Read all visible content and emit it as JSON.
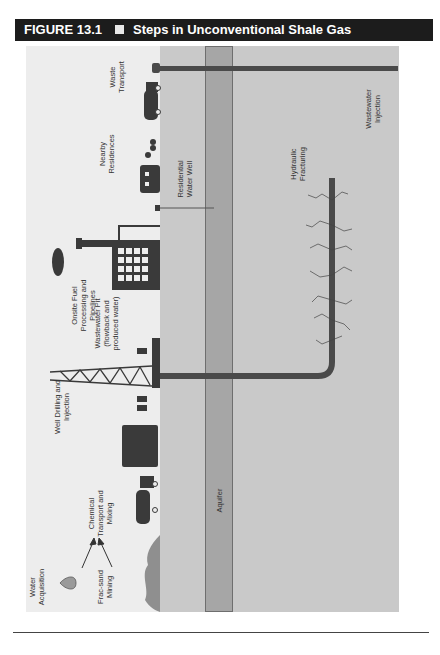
{
  "figure": {
    "number": "FIGURE 13.1",
    "separator": "■",
    "title": "Steps in Unconventional Shale Gas Development"
  },
  "labels": {
    "waste_transport": "Waste\nTransport",
    "nearby_residences": "Nearby\nResidences",
    "residential_water_well": "Residential\nWater Well",
    "onsite_fuel": "Onsite Fuel\nProcessing and\nPipelines",
    "wastewater_pit": "Wastewater Pit\n(flowback and\nproduced water)",
    "well_drilling": "Well Drilling and\nInjection",
    "chemical_transport": "Chemical\nTransport and\nMixing",
    "water_acquisition": "Water\nAcquisition",
    "frac_sand": "Frac-sand\nMining",
    "aquifer": "Aquifer",
    "hydraulic_fracturing": "Hydraulic\nFracturing",
    "wastewater_injection": "Wastewater\nInjection"
  },
  "colors": {
    "header_bg": "#1c1c1c",
    "surface": "#ededed",
    "ground": "#c9c9c9",
    "aquifer": "#a6a6a6",
    "pipe": "#4a4a4a"
  }
}
